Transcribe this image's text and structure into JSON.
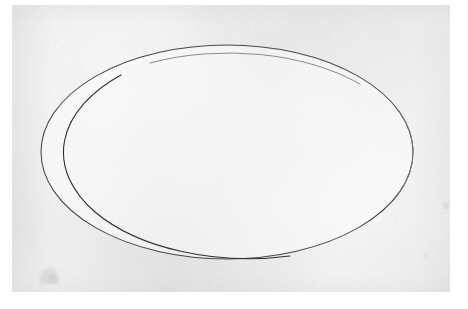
{
  "document": {
    "kind": "scanned-drawing",
    "title": "Hand-drawn ellipse on paper",
    "width_px": 468,
    "height_px": 309,
    "visible_text": "",
    "caption": ""
  },
  "colors": {
    "scanner_margin": "#ffffff",
    "paper_base": "#f1f1f1",
    "paper_light": "#f5f5f5",
    "paper_shadow": "#ececec",
    "ink_line": "#4a4a4a",
    "ink_line_dark": "#2e2e2e",
    "ink_line_faint": "#7d7d7d",
    "smudge": "#d9d9d9"
  },
  "paper": {
    "left": 12,
    "top": 5,
    "width": 438,
    "height": 287,
    "tone": "off-white gray"
  },
  "figure": {
    "shape": "ellipse",
    "center_x": 227,
    "center_y": 152,
    "radius_x": 186,
    "radius_y": 107,
    "stroke_width": 1,
    "stroke_color": "#4a4a4a",
    "filled": false,
    "bounds": {
      "left": 41,
      "top": 45,
      "right": 413,
      "bottom": 259
    }
  },
  "artifacts": [
    {
      "name": "smudge",
      "x": 40,
      "y": 268,
      "width": 18,
      "height": 16,
      "color": "#d9d9d9"
    },
    {
      "name": "speck-right",
      "x": 444,
      "y": 204,
      "width": 4,
      "height": 4,
      "color": "#d5d5d5"
    },
    {
      "name": "speck-lower-right",
      "x": 424,
      "y": 254,
      "width": 3,
      "height": 3,
      "color": "#d5d5d5"
    }
  ]
}
